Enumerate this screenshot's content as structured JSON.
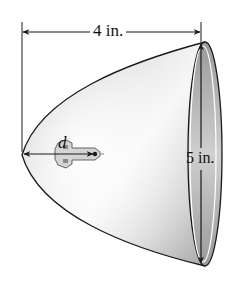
{
  "figure": {
    "type": "parabolic reflector with bulb",
    "labels": {
      "depth": "4 in.",
      "diameter": "5 in.",
      "focus_distance": "d"
    },
    "colors": {
      "outline": "#1a1a1a",
      "shade_dark": "#8c8c8c",
      "shade_light": "#f4f4f4",
      "background": "#ffffff"
    }
  }
}
